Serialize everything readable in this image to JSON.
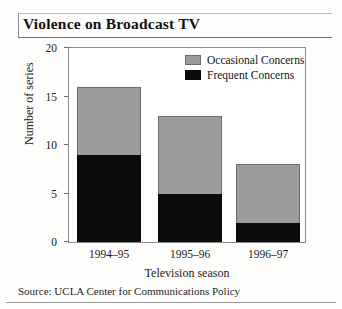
{
  "figure": {
    "title": "Violence on Broadcast TV",
    "source_note": "Source: UCLA Center for Communications Policy"
  },
  "chart_data": {
    "type": "bar",
    "stacked": true,
    "title": "Violence on Broadcast TV",
    "xlabel": "Television season",
    "ylabel": "Number of series",
    "categories": [
      "1994–95",
      "1995–96",
      "1996–97"
    ],
    "series": [
      {
        "name": "Frequent Concerns",
        "values": [
          9,
          5,
          2
        ],
        "color": "#0b0b0b"
      },
      {
        "name": "Occasional Concerns",
        "values": [
          7,
          8,
          6
        ],
        "color": "#9c9c9c"
      }
    ],
    "totals": [
      16,
      13,
      8
    ],
    "ylim": [
      0,
      20
    ],
    "yticks": [
      0,
      5,
      10,
      15,
      20
    ],
    "ytick_labels": [
      "0",
      "5",
      "10",
      "15",
      "20"
    ],
    "grid": false,
    "legend_position": "top-right-inside",
    "legend_order": [
      "Occasional Concerns",
      "Frequent Concerns"
    ]
  }
}
